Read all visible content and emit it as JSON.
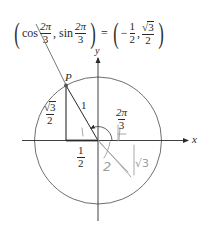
{
  "equation": {
    "lhs_open": "(",
    "cos_fn": "cos",
    "cos_arg": {
      "num": "2π",
      "den": "3"
    },
    "comma1": ",",
    "sin_fn": "sin",
    "sin_arg": {
      "num": "2π",
      "den": "3"
    },
    "lhs_close": ")",
    "equals": "=",
    "rhs_open": "(",
    "x_sign": "−",
    "x_val": {
      "num": "1",
      "den": "2"
    },
    "comma2": ",",
    "y_val": {
      "num_radical": "√",
      "num_radicand": "3",
      "den": "2"
    },
    "rhs_close": ")"
  },
  "axes": {
    "x_label": "x",
    "y_label": "y"
  },
  "point": {
    "label": "P"
  },
  "triangle": {
    "hypotenuse_label": "1",
    "height_label": {
      "radical": "√",
      "radicand": "3",
      "den": "2"
    },
    "base_label": {
      "num": "1",
      "den": "2"
    }
  },
  "angle": {
    "label": {
      "num": "2π",
      "den": "3"
    }
  },
  "handwritten": {
    "note_2": "2",
    "note_sqrt3": "√3"
  },
  "colors": {
    "ink": "#2a2a2a",
    "circle": "#6f6f6f",
    "point": "#555555",
    "pencil": "#9aa09a"
  }
}
